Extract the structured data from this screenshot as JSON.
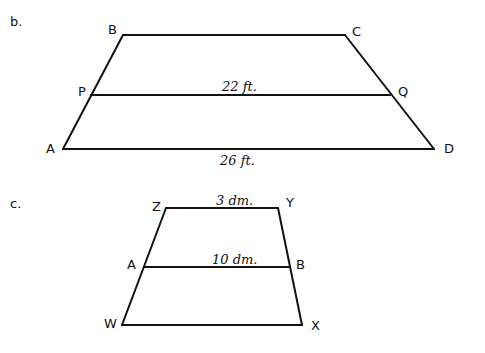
{
  "figures": [
    {
      "part_label": "b.",
      "shape": "trapezoid",
      "vertices": {
        "B": "B",
        "C": "C",
        "D": "D",
        "A": "A"
      },
      "midpoints": {
        "P": "P",
        "Q": "Q"
      },
      "segments": [
        {
          "name": "BC",
          "measure": ""
        },
        {
          "name": "PQ",
          "measure": "22 ft."
        },
        {
          "name": "AD",
          "measure": "26 ft."
        }
      ]
    },
    {
      "part_label": "c.",
      "shape": "trapezoid",
      "vertices": {
        "Z": "Z",
        "Y": "Y",
        "X": "X",
        "W": "W"
      },
      "midpoints": {
        "A": "A",
        "B": "B"
      },
      "segments": [
        {
          "name": "ZY",
          "measure": "3 dm."
        },
        {
          "name": "AB",
          "measure": "10 dm."
        },
        {
          "name": "WX",
          "measure": ""
        }
      ]
    }
  ],
  "colors": {
    "ink": "#111111",
    "paper": "#ffffff"
  }
}
